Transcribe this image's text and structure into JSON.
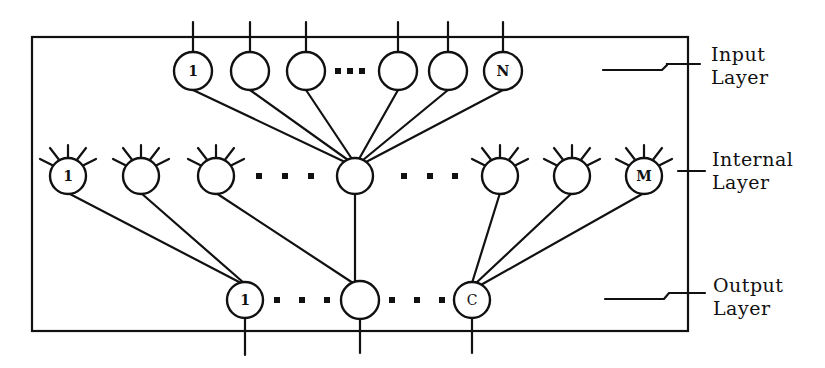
{
  "diagram": {
    "colors": {
      "ink": "#111111",
      "background": "#ffffff"
    },
    "layers": {
      "input": {
        "label_line1": "Input",
        "label_line2": "Layer",
        "first_node_label": "1",
        "last_node_label": "N",
        "node_count_visible": 6,
        "ellipsis": "..."
      },
      "internal": {
        "label_line1": "Internal",
        "label_line2": "Layer",
        "first_node_label": "1",
        "last_node_label": "M",
        "node_count_visible": 7,
        "ellipsis": "..."
      },
      "output": {
        "label_line1": "Output",
        "label_line2": "Layer",
        "first_node_label": "1",
        "last_node_label": "C",
        "node_count_visible": 3,
        "ellipsis": "..."
      }
    }
  }
}
